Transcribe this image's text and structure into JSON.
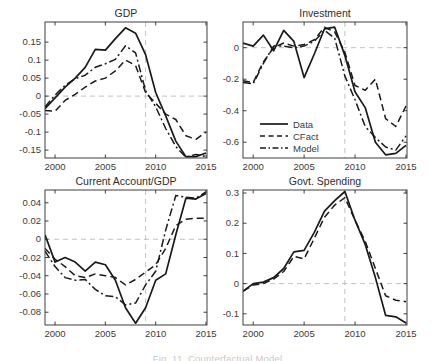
{
  "figure": {
    "caption": "Fig. 11. Counterfactual Model",
    "colors": {
      "background": "#ffffff",
      "line": "#1a1a1a",
      "ref": "#b3b3b3",
      "frame": "#2b2b2b",
      "tick_label": "#3a3a3a",
      "title": "#2e2e2e"
    }
  },
  "years": [
    1999,
    2000,
    2001,
    2002,
    2003,
    2004,
    2005,
    2006,
    2007,
    2008,
    2009,
    2010,
    2011,
    2012,
    2013,
    2014,
    2015
  ],
  "chart_data": [
    {
      "type": "line",
      "title": "GDP",
      "xlabel": "",
      "ylabel": "",
      "xlim": [
        1999,
        2015.1
      ],
      "ylim": [
        -0.172,
        0.206
      ],
      "xticks": [
        2000,
        2005,
        2010,
        2015
      ],
      "yticks": [
        0.15,
        0.1,
        0.05,
        0,
        -0.05,
        -0.1,
        -0.15
      ],
      "ref_hline": 0,
      "ref_vline": 2009,
      "grid": false,
      "layout": {
        "left": 45,
        "top": 22,
        "width": 162,
        "height": 136
      },
      "series": [
        {
          "name": "Data",
          "style": "solid",
          "values": [
            -0.035,
            -0.005,
            0.025,
            0.05,
            0.08,
            0.13,
            0.128,
            0.16,
            0.19,
            0.175,
            0.115,
            0.01,
            -0.055,
            -0.125,
            -0.168,
            -0.168,
            -0.158
          ]
        },
        {
          "name": "CFact",
          "style": "dashed",
          "values": [
            -0.04,
            -0.042,
            -0.012,
            0.005,
            0.025,
            0.042,
            0.05,
            0.07,
            0.1,
            0.085,
            0.01,
            -0.02,
            -0.05,
            -0.065,
            -0.11,
            -0.12,
            -0.1
          ]
        },
        {
          "name": "Model",
          "style": "dashdot",
          "values": [
            -0.03,
            0.003,
            0.03,
            0.048,
            0.058,
            0.08,
            0.09,
            0.102,
            0.14,
            0.12,
            0.015,
            -0.03,
            -0.09,
            -0.14,
            -0.17,
            -0.162,
            -0.168
          ]
        }
      ]
    },
    {
      "type": "line",
      "title": "Investment",
      "xlabel": "",
      "ylabel": "",
      "xlim": [
        1999,
        2015.1
      ],
      "ylim": [
        -0.7,
        0.163
      ],
      "xticks": [
        2000,
        2005,
        2010,
        2015
      ],
      "yticks": [
        0,
        -0.2,
        -0.4,
        -0.6
      ],
      "ref_hline": 0,
      "ref_vline": 2009,
      "grid": false,
      "layout": {
        "left": 243,
        "top": 22,
        "width": 164,
        "height": 136
      },
      "legend": {
        "position": "lower-left-inside",
        "x": 17,
        "y": 102,
        "row_h": 12,
        "sample_w": 28,
        "entries": [
          {
            "label": "Data",
            "style": "solid"
          },
          {
            "label": "CFact",
            "style": "dashed"
          },
          {
            "label": "Model",
            "style": "dashdot"
          }
        ]
      },
      "series": [
        {
          "name": "Data",
          "style": "solid",
          "values": [
            0.03,
            0.01,
            0.08,
            -0.02,
            0.11,
            0.04,
            -0.19,
            -0.04,
            0.12,
            0.13,
            -0.05,
            -0.28,
            -0.38,
            -0.6,
            -0.68,
            -0.67,
            -0.62
          ]
        },
        {
          "name": "CFact",
          "style": "dashed",
          "values": [
            -0.21,
            -0.22,
            -0.09,
            0.0,
            0.03,
            0.01,
            0.02,
            0.05,
            0.13,
            0.1,
            -0.03,
            -0.24,
            -0.27,
            -0.2,
            -0.45,
            -0.5,
            -0.37
          ]
        },
        {
          "name": "Model",
          "style": "dashdot",
          "values": [
            -0.22,
            -0.23,
            -0.1,
            0.01,
            0.01,
            0.0,
            0.01,
            0.04,
            0.11,
            0.06,
            -0.18,
            -0.33,
            -0.5,
            -0.57,
            -0.63,
            -0.65,
            -0.56
          ]
        }
      ]
    },
    {
      "type": "line",
      "title": "Current Account/GDP",
      "xlabel": "",
      "ylabel": "",
      "xlim": [
        1999,
        2015.1
      ],
      "ylim": [
        -0.094,
        0.054
      ],
      "xticks": [
        2000,
        2005,
        2010,
        2015
      ],
      "yticks": [
        0.04,
        0.02,
        0,
        -0.02,
        -0.04,
        -0.06,
        -0.08
      ],
      "ref_hline": 0,
      "ref_vline": 2009,
      "grid": false,
      "layout": {
        "left": 45,
        "top": 190,
        "width": 162,
        "height": 135
      },
      "series": [
        {
          "name": "Data",
          "style": "solid",
          "values": [
            0.005,
            -0.025,
            -0.02,
            -0.025,
            -0.035,
            -0.025,
            -0.028,
            -0.045,
            -0.075,
            -0.092,
            -0.075,
            -0.045,
            -0.038,
            0.005,
            0.045,
            0.044,
            0.05
          ]
        },
        {
          "name": "CFact",
          "style": "dashed",
          "values": [
            -0.01,
            -0.022,
            -0.03,
            -0.04,
            -0.042,
            -0.038,
            -0.04,
            -0.042,
            -0.05,
            -0.044,
            -0.036,
            -0.028,
            -0.01,
            0.015,
            0.022,
            0.023,
            0.023
          ]
        },
        {
          "name": "Model",
          "style": "dashdot",
          "values": [
            -0.013,
            -0.03,
            -0.042,
            -0.045,
            -0.044,
            -0.055,
            -0.062,
            -0.063,
            -0.072,
            -0.07,
            -0.05,
            -0.035,
            0.01,
            0.048,
            0.046,
            0.045,
            0.052
          ]
        }
      ]
    },
    {
      "type": "line",
      "title": "Govt. Spending",
      "xlabel": "",
      "ylabel": "",
      "xlim": [
        1999,
        2015.1
      ],
      "ylim": [
        -0.137,
        0.31
      ],
      "xticks": [
        2000,
        2005,
        2010,
        2015
      ],
      "yticks": [
        0.3,
        0.2,
        0.1,
        0,
        -0.1
      ],
      "ref_hline": 0,
      "ref_vline": 2009,
      "grid": false,
      "layout": {
        "left": 243,
        "top": 190,
        "width": 164,
        "height": 135
      },
      "series": [
        {
          "name": "Data",
          "style": "solid",
          "values": [
            -0.025,
            0.0,
            0.005,
            0.02,
            0.05,
            0.105,
            0.11,
            0.17,
            0.24,
            0.275,
            0.305,
            0.21,
            0.13,
            0.02,
            -0.105,
            -0.11,
            -0.13
          ]
        },
        {
          "name": "CFact",
          "style": "dashed",
          "values": [
            -0.025,
            -0.005,
            0.0,
            0.015,
            0.04,
            0.09,
            0.082,
            0.15,
            0.22,
            0.26,
            0.285,
            0.21,
            0.14,
            0.05,
            -0.04,
            -0.055,
            -0.06
          ]
        }
      ]
    }
  ]
}
